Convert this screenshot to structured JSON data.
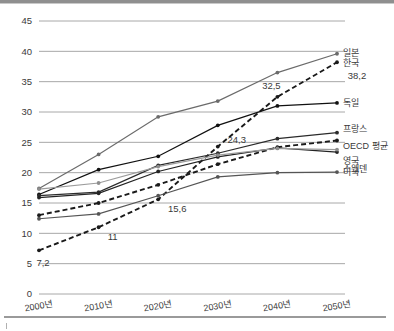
{
  "chart_data": {
    "type": "line",
    "title": "",
    "xlabel": "",
    "ylabel": "",
    "x": [
      "2000년",
      "2010년",
      "2020년",
      "2030년",
      "2040년",
      "2050년"
    ],
    "ylim": [
      0,
      45
    ],
    "yticks": [
      "0",
      "5",
      "10",
      "15",
      "20",
      "25",
      "30",
      "35",
      "40",
      "45"
    ],
    "grid": true,
    "legend_position": "right-inline",
    "series": [
      {
        "name": "일본",
        "values": [
          17.4,
          23.0,
          29.2,
          31.8,
          36.5,
          39.6
        ],
        "color": "#6b6b6b",
        "style": "solid",
        "marker": "circle"
      },
      {
        "name": "한국",
        "values": [
          7.2,
          11.0,
          15.6,
          24.3,
          32.5,
          38.2
        ],
        "color": "#1a1a1a",
        "style": "dashed",
        "marker": "circle"
      },
      {
        "name": "독일",
        "values": [
          16.4,
          20.5,
          22.7,
          27.8,
          31.0,
          31.5
        ],
        "color": "#111111",
        "style": "solid",
        "marker": "circle"
      },
      {
        "name": "프랑스",
        "values": [
          16.2,
          16.8,
          21.2,
          23.2,
          25.6,
          26.6
        ],
        "color": "#2b2b2b",
        "style": "solid",
        "marker": "circle"
      },
      {
        "name": "OECD 평균",
        "values": [
          13.0,
          15.0,
          18.0,
          21.4,
          24.2,
          25.3
        ],
        "color": "#1a1a1a",
        "style": "dashed",
        "marker": "circle"
      },
      {
        "name": "영국",
        "values": [
          15.9,
          16.6,
          20.2,
          22.6,
          24.1,
          23.4
        ],
        "color": "#242424",
        "style": "solid",
        "marker": "circle"
      },
      {
        "name": "스웨덴",
        "values": [
          17.3,
          18.3,
          21.0,
          22.9,
          24.0,
          23.8
        ],
        "color": "#9c9c9c",
        "style": "solid",
        "marker": "circle"
      },
      {
        "name": "미국",
        "values": [
          12.4,
          13.2,
          16.2,
          19.3,
          20.0,
          20.1
        ],
        "color": "#555555",
        "style": "solid",
        "marker": "circle"
      }
    ],
    "annotations": [
      {
        "text": "7,2",
        "series": "한국",
        "x_index": 0,
        "value": 7.2,
        "dx": 4,
        "dy": 16
      },
      {
        "text": "11",
        "series": "한국",
        "x_index": 1,
        "value": 11.0,
        "dx": 14,
        "dy": 13
      },
      {
        "text": "15,6",
        "series": "한국",
        "x_index": 2,
        "value": 15.6,
        "dx": 19,
        "dy": 13
      },
      {
        "text": "24,3",
        "series": "한국",
        "x_index": 3,
        "value": 24.3,
        "dx": 19,
        "dy": -4
      },
      {
        "text": "32,5",
        "series": "한국",
        "x_index": 4,
        "value": 32.5,
        "dx": -6,
        "dy": -8
      },
      {
        "text": "38,2",
        "series": "한국",
        "x_index": 5,
        "value": 38.2,
        "dx": 20,
        "dy": 17
      }
    ]
  },
  "axis": {
    "y_label_color": "#3a3a3a",
    "x_label_color": "#3a3a3a",
    "grid_color": "#a8a8a8",
    "plot_background": "#ffffff"
  }
}
